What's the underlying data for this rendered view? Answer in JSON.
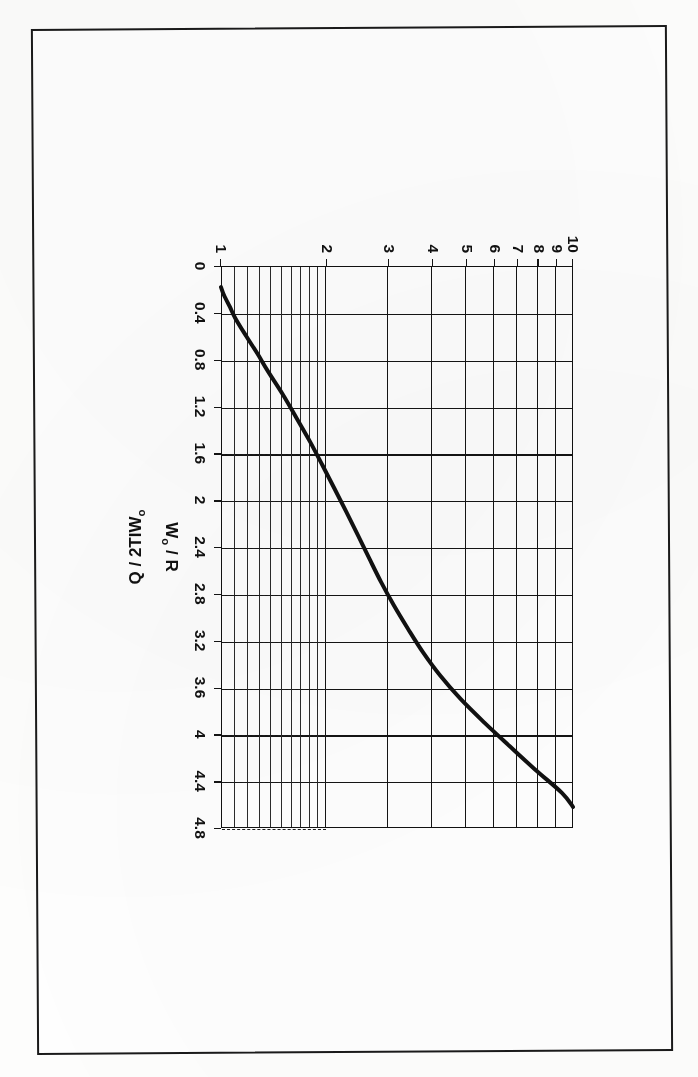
{
  "document": {
    "kind": "scanned-figure-page",
    "page_background": "#ffffff",
    "frame_color": "#1a1a1a",
    "figure_rotation_degrees": 90
  },
  "chart_data": {
    "type": "line",
    "title": "",
    "subtitle": "",
    "xlabel": "W₀ / R",
    "xlabel_main": "W",
    "xlabel_sub": "o",
    "xlabel_tail": " / R",
    "ylabel": "Q / 2TIW₀",
    "ylabel_main": "Q / 2TIW",
    "ylabel_sub": "o",
    "xlim": [
      0,
      4.8
    ],
    "ylim": [
      1,
      10
    ],
    "yscale": "log",
    "xscale": "linear",
    "grid": true,
    "grid_style": "major solid, minor dashed below y=2",
    "legend": "none",
    "line_color": "#111111",
    "line_width_px": 4,
    "xticks": [
      "0",
      "0.4",
      "0.8",
      "1.2",
      "1.6",
      "2",
      "2.4",
      "2.8",
      "3.2",
      "3.6",
      "4",
      "4.4",
      "4.8"
    ],
    "xtick_values": [
      0,
      0.4,
      0.8,
      1.2,
      1.6,
      2,
      2.4,
      2.8,
      3.2,
      3.6,
      4,
      4.4,
      4.8
    ],
    "yticks": [
      "1",
      "2",
      "3",
      "4",
      "5",
      "6",
      "7",
      "8",
      "9",
      "10"
    ],
    "ytick_values": [
      1,
      2,
      3,
      4,
      5,
      6,
      7,
      8,
      9,
      10
    ],
    "y_minor_values": [
      1.1,
      1.2,
      1.3,
      1.4,
      1.5,
      1.6,
      1.7,
      1.8,
      1.9
    ],
    "x": [
      0.18,
      0.25,
      0.35,
      0.45,
      0.6,
      0.75,
      0.9,
      1.1,
      1.3,
      1.5,
      1.7,
      1.9,
      2.1,
      2.3,
      2.5,
      2.7,
      2.9,
      3.1,
      3.3,
      3.5,
      3.7,
      3.9,
      4.1,
      4.3,
      4.5,
      4.62
    ],
    "y": [
      1.0,
      1.02,
      1.06,
      1.1,
      1.18,
      1.27,
      1.36,
      1.5,
      1.64,
      1.79,
      1.94,
      2.1,
      2.27,
      2.45,
      2.64,
      2.85,
      3.1,
      3.4,
      3.75,
      4.2,
      4.8,
      5.6,
      6.6,
      7.8,
      9.3,
      10.0
    ],
    "series": [
      {
        "name": "Q / 2TIW₀ vs W₀ / R",
        "x": [
          0.18,
          0.25,
          0.35,
          0.45,
          0.6,
          0.75,
          0.9,
          1.1,
          1.3,
          1.5,
          1.7,
          1.9,
          2.1,
          2.3,
          2.5,
          2.7,
          2.9,
          3.1,
          3.3,
          3.5,
          3.7,
          3.9,
          4.1,
          4.3,
          4.5,
          4.62
        ],
        "y": [
          1.0,
          1.02,
          1.06,
          1.1,
          1.18,
          1.27,
          1.36,
          1.5,
          1.64,
          1.79,
          1.94,
          2.1,
          2.27,
          2.45,
          2.64,
          2.85,
          3.1,
          3.4,
          3.75,
          4.2,
          4.8,
          5.6,
          6.6,
          7.8,
          9.3,
          10.0
        ]
      }
    ]
  }
}
